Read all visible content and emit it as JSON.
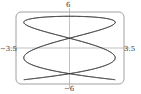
{
  "chart_data": {
    "type": "line",
    "title": "",
    "subtitle": "",
    "xlabel": "",
    "ylabel": "",
    "xlim": [
      -3.5,
      3.5
    ],
    "ylim": [
      -6,
      6
    ],
    "grid": false,
    "legend": null,
    "tick_labels": {
      "top": "6",
      "bottom": "-6",
      "left": "-3.5",
      "right": "3.5"
    },
    "series": [
      {
        "name": "parametric curve",
        "kind": "lissajous",
        "x_amplitude": 3.2,
        "y_amplitude": 5.6,
        "x_frequency": 5,
        "y_frequency": 2,
        "color": "#333333"
      }
    ]
  },
  "labels": {
    "top": "6",
    "bottom": "−6",
    "left": "−3.5",
    "right": "3.5"
  },
  "colors": {
    "frame": "#888888",
    "axes": "#999999",
    "curve": "#333333"
  }
}
